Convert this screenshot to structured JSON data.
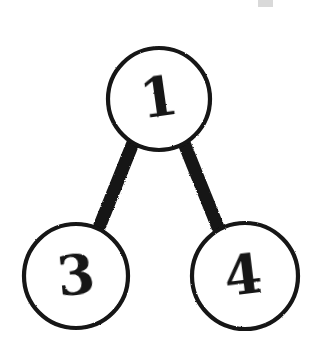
{
  "canvas": {
    "width": 324,
    "height": 360,
    "background_color": "#ffffff",
    "ink_color": "#141414",
    "style": "hand-drawn-sketch"
  },
  "diagram": {
    "type": "graph",
    "title": "",
    "node_shape": "circle",
    "node_fill": "#ffffff",
    "node_stroke_color": "#141414",
    "node_stroke_width": 4,
    "edge_color": "#141414",
    "edge_width": 13,
    "nodes": [
      {
        "id": "n1",
        "label": "1",
        "cx": 159,
        "cy": 99,
        "r": 51,
        "label_x": 159,
        "label_y": 116,
        "label_font_size": 54,
        "label_rotation": -8
      },
      {
        "id": "n3",
        "label": "3",
        "cx": 76,
        "cy": 276,
        "r": 52,
        "label_x": 76,
        "label_y": 294,
        "label_font_size": 54,
        "label_rotation": -6
      },
      {
        "id": "n4",
        "label": "4",
        "cx": 245,
        "cy": 276,
        "r": 53,
        "label_x": 243,
        "label_y": 294,
        "label_font_size": 54,
        "label_rotation": -7
      }
    ],
    "edges": [
      {
        "id": "e1",
        "from": "n1",
        "to": "n3",
        "x1": 133,
        "y1": 143,
        "x2": 98,
        "y2": 230
      },
      {
        "id": "e2",
        "from": "n1",
        "to": "n4",
        "x1": 184,
        "y1": 143,
        "x2": 219,
        "y2": 230
      }
    ],
    "artifacts": [
      {
        "id": "a1",
        "name": "scan-speck",
        "x": 258,
        "y": 0,
        "width": 15,
        "height": 7,
        "opacity": 0.16
      }
    ]
  }
}
